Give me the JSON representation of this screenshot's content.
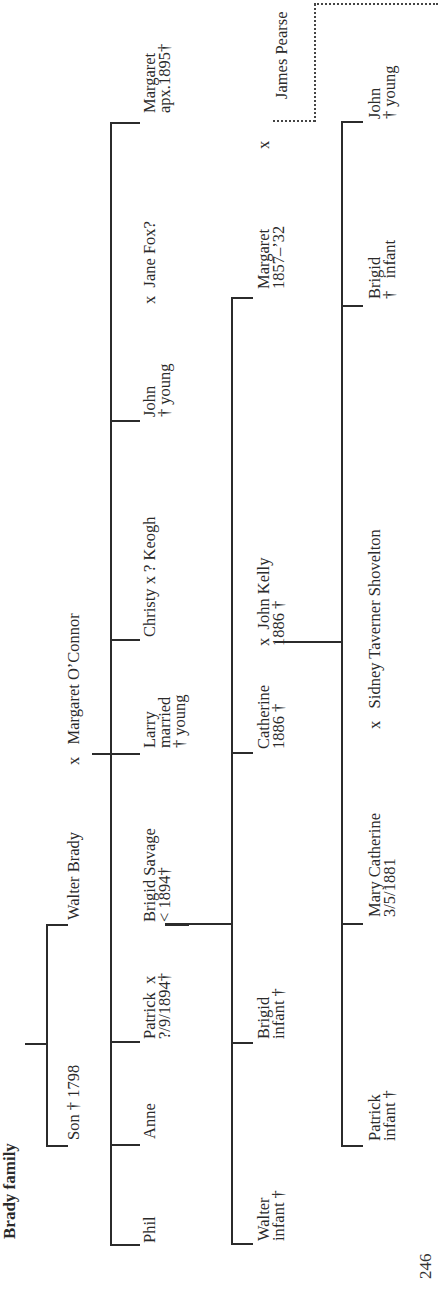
{
  "page": {
    "title": "Brady family",
    "page_number": "246"
  },
  "tree": {
    "gen1": {
      "son": "Son † 1798",
      "walter": "Walter Brady",
      "spouse": "x   Margaret O’Connor"
    },
    "gen2": {
      "phil": "Phil",
      "anne": "Anne",
      "patrick": "Patrick  x\n?/9/1894†",
      "brigid_savage": "Brigid Savage\n< 1894†",
      "larry": "Larry\nmarried\n† young",
      "christy": "Christy x ? Keogh",
      "john": "John\n† young",
      "john_spouse": "x  Jane Fox?",
      "margaret": "Margaret\napx.1895†"
    },
    "gen3": {
      "walter": "Walter\ninfant †",
      "brigid": "Brigid\ninfant †",
      "catherine": "Catherine\n1886 †",
      "john_kelly": "x  John Kelly\n1886 †",
      "margaret": "Margaret\n1857–’32",
      "margaret_x": "x",
      "james_pearse": "James Pearse"
    },
    "gen4": {
      "patrick": "Patrick\ninfant †",
      "mary_catherine": "Mary Catherine\n3/5/1881",
      "spouse": "x   Sidney Taverner Shovelton",
      "brigid": "Brigid\n†   infant",
      "john": "John\n† young"
    }
  }
}
